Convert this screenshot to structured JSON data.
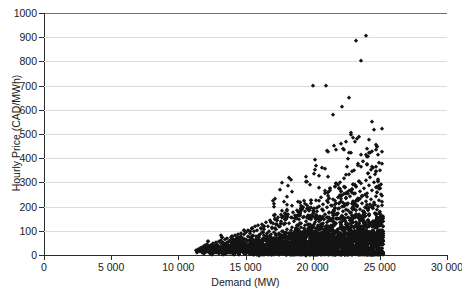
{
  "chart_data": {
    "type": "scatter",
    "title": "",
    "xlabel": "Demand (MW)",
    "ylabel": "Hourly Price (CAD/MWh)",
    "xlim": [
      0,
      30000
    ],
    "ylim": [
      0,
      1000
    ],
    "xticks": [
      0,
      5000,
      10000,
      15000,
      20000,
      25000,
      30000
    ],
    "xticklabels": [
      "0",
      "5 000",
      "10 000",
      "15 000",
      "20 000",
      "25 000",
      "30 000"
    ],
    "yticks": [
      0,
      100,
      200,
      300,
      400,
      500,
      600,
      700,
      800,
      900,
      1000
    ],
    "yticklabels": [
      "0",
      "100",
      "200",
      "300",
      "400",
      "500",
      "600",
      "700",
      "800",
      "900",
      "1000"
    ],
    "grid": "horizontal",
    "legend": "none",
    "marker": "diamond",
    "marker_color": "#141414",
    "series_name": "Hourly price vs demand",
    "notable_outliers": [
      {
        "x": 23200,
        "y": 885
      },
      {
        "x": 24000,
        "y": 905
      },
      {
        "x": 23600,
        "y": 800
      },
      {
        "x": 20000,
        "y": 700
      },
      {
        "x": 21000,
        "y": 700
      },
      {
        "x": 22700,
        "y": 650
      },
      {
        "x": 22200,
        "y": 610
      },
      {
        "x": 21500,
        "y": 580
      }
    ],
    "points": [
      [
        11300,
        20
      ],
      [
        11450,
        25
      ],
      [
        11520,
        18
      ],
      [
        11600,
        30
      ],
      [
        11700,
        22
      ],
      [
        11780,
        35
      ],
      [
        11850,
        28
      ],
      [
        11900,
        15
      ],
      [
        11950,
        40
      ],
      [
        12000,
        26
      ],
      [
        12050,
        33
      ],
      [
        12100,
        21
      ],
      [
        12150,
        45
      ],
      [
        12200,
        30
      ],
      [
        12250,
        24
      ],
      [
        12300,
        38
      ],
      [
        12350,
        29
      ],
      [
        12400,
        42
      ],
      [
        12450,
        27
      ],
      [
        12500,
        35
      ],
      [
        12550,
        48
      ],
      [
        12600,
        31
      ],
      [
        12650,
        22
      ],
      [
        12700,
        40
      ],
      [
        12750,
        36
      ],
      [
        12800,
        52
      ],
      [
        12850,
        28
      ],
      [
        12900,
        44
      ],
      [
        12950,
        33
      ],
      [
        13000,
        57
      ],
      [
        13050,
        39
      ],
      [
        13100,
        26
      ],
      [
        13150,
        48
      ],
      [
        13200,
        60
      ],
      [
        13250,
        35
      ],
      [
        13300,
        42
      ],
      [
        13350,
        55
      ],
      [
        13400,
        31
      ],
      [
        13450,
        66
      ],
      [
        13500,
        45
      ],
      [
        13550,
        38
      ],
      [
        13600,
        52
      ],
      [
        13650,
        70
      ],
      [
        13700,
        41
      ],
      [
        13750,
        59
      ],
      [
        13800,
        34
      ],
      [
        13850,
        63
      ],
      [
        13900,
        47
      ],
      [
        13950,
        75
      ],
      [
        14000,
        52
      ],
      [
        14050,
        40
      ],
      [
        14100,
        68
      ],
      [
        14150,
        57
      ],
      [
        14200,
        82
      ],
      [
        14250,
        45
      ],
      [
        14300,
        61
      ],
      [
        14350,
        73
      ],
      [
        14400,
        50
      ],
      [
        14450,
        88
      ],
      [
        14500,
        58
      ],
      [
        14550,
        66
      ],
      [
        14600,
        44
      ],
      [
        14650,
        79
      ],
      [
        14700,
        92
      ],
      [
        14750,
        55
      ],
      [
        14800,
        70
      ],
      [
        14850,
        62
      ],
      [
        14900,
        85
      ],
      [
        14950,
        48
      ],
      [
        15000,
        97
      ],
      [
        15050,
        68
      ],
      [
        15100,
        57
      ],
      [
        15150,
        80
      ],
      [
        15200,
        103
      ],
      [
        15250,
        63
      ],
      [
        15300,
        74
      ],
      [
        15350,
        90
      ],
      [
        15400,
        52
      ],
      [
        15450,
        110
      ],
      [
        15500,
        71
      ],
      [
        15550,
        84
      ],
      [
        15600,
        60
      ],
      [
        15650,
        98
      ],
      [
        15700,
        118
      ],
      [
        15750,
        67
      ],
      [
        15800,
        79
      ],
      [
        15850,
        105
      ],
      [
        15900,
        56
      ],
      [
        15950,
        125
      ],
      [
        16000,
        73
      ],
      [
        16050,
        88
      ],
      [
        16100,
        64
      ],
      [
        16150,
        112
      ],
      [
        16200,
        95
      ],
      [
        16250,
        130
      ],
      [
        16300,
        70
      ],
      [
        16350,
        82
      ],
      [
        16400,
        108
      ],
      [
        16450,
        61
      ],
      [
        16500,
        138
      ],
      [
        16550,
        76
      ],
      [
        16600,
        92
      ],
      [
        16650,
        120
      ],
      [
        16700,
        68
      ],
      [
        16750,
        101
      ],
      [
        16800,
        145
      ],
      [
        16850,
        79
      ],
      [
        16900,
        87
      ],
      [
        16950,
        115
      ],
      [
        17000,
        64
      ],
      [
        17050,
        132
      ],
      [
        17100,
        95
      ],
      [
        17150,
        72
      ],
      [
        17200,
        148
      ],
      [
        17250,
        84
      ],
      [
        17300,
        106
      ],
      [
        17350,
        128
      ],
      [
        17400,
        69
      ],
      [
        17450,
        155
      ],
      [
        17500,
        91
      ],
      [
        17550,
        77
      ],
      [
        17600,
        118
      ],
      [
        17650,
        140
      ],
      [
        17700,
        83
      ],
      [
        17750,
        99
      ],
      [
        17800,
        162
      ],
      [
        17850,
        74
      ],
      [
        17900,
        127
      ],
      [
        17950,
        88
      ],
      [
        18000,
        150
      ],
      [
        18050,
        95
      ],
      [
        18100,
        108
      ],
      [
        18150,
        170
      ],
      [
        18200,
        80
      ],
      [
        18250,
        134
      ],
      [
        18300,
        92
      ],
      [
        18350,
        158
      ],
      [
        18400,
        102
      ],
      [
        18450,
        116
      ],
      [
        18500,
        178
      ],
      [
        18550,
        86
      ],
      [
        18600,
        142
      ],
      [
        18650,
        97
      ],
      [
        18700,
        165
      ],
      [
        18750,
        110
      ],
      [
        18800,
        124
      ],
      [
        18850,
        186
      ],
      [
        18900,
        90
      ],
      [
        18950,
        150
      ],
      [
        19000,
        104
      ],
      [
        19050,
        172
      ],
      [
        19100,
        117
      ],
      [
        19150,
        132
      ],
      [
        19200,
        195
      ],
      [
        19250,
        95
      ],
      [
        19300,
        158
      ],
      [
        19350,
        110
      ],
      [
        19400,
        180
      ],
      [
        19450,
        123
      ],
      [
        19500,
        140
      ],
      [
        19550,
        205
      ],
      [
        19600,
        100
      ],
      [
        19650,
        166
      ],
      [
        19700,
        115
      ],
      [
        19750,
        188
      ],
      [
        19800,
        130
      ],
      [
        19850,
        148
      ],
      [
        19900,
        215
      ],
      [
        19950,
        105
      ],
      [
        20000,
        174
      ],
      [
        20050,
        120
      ],
      [
        20100,
        196
      ],
      [
        20150,
        136
      ],
      [
        20200,
        155
      ],
      [
        20250,
        228
      ],
      [
        20300,
        110
      ],
      [
        20350,
        182
      ],
      [
        20400,
        126
      ],
      [
        20450,
        204
      ],
      [
        20500,
        142
      ],
      [
        20550,
        163
      ],
      [
        20600,
        240
      ],
      [
        20650,
        115
      ],
      [
        20700,
        190
      ],
      [
        20750,
        132
      ],
      [
        20800,
        212
      ],
      [
        20850,
        150
      ],
      [
        20900,
        170
      ],
      [
        20950,
        255
      ],
      [
        21000,
        120
      ],
      [
        21050,
        198
      ],
      [
        21100,
        138
      ],
      [
        21150,
        220
      ],
      [
        21200,
        158
      ],
      [
        21250,
        178
      ],
      [
        21300,
        270
      ],
      [
        21350,
        126
      ],
      [
        21400,
        206
      ],
      [
        21450,
        144
      ],
      [
        21500,
        230
      ],
      [
        21550,
        165
      ],
      [
        21600,
        186
      ],
      [
        21650,
        285
      ],
      [
        21700,
        132
      ],
      [
        21750,
        215
      ],
      [
        21800,
        152
      ],
      [
        21850,
        240
      ],
      [
        21900,
        172
      ],
      [
        21950,
        195
      ],
      [
        22000,
        300
      ],
      [
        22050,
        138
      ],
      [
        22100,
        224
      ],
      [
        22150,
        160
      ],
      [
        22200,
        250
      ],
      [
        22250,
        180
      ],
      [
        22300,
        204
      ],
      [
        22350,
        318
      ],
      [
        22400,
        145
      ],
      [
        22450,
        234
      ],
      [
        22500,
        168
      ],
      [
        22550,
        262
      ],
      [
        22600,
        188
      ],
      [
        22650,
        214
      ],
      [
        22700,
        335
      ],
      [
        22750,
        152
      ],
      [
        22800,
        244
      ],
      [
        22850,
        176
      ],
      [
        22900,
        274
      ],
      [
        22950,
        196
      ],
      [
        23000,
        224
      ],
      [
        23050,
        352
      ],
      [
        23100,
        160
      ],
      [
        23150,
        255
      ],
      [
        23200,
        184
      ],
      [
        23250,
        286
      ],
      [
        23300,
        205
      ],
      [
        23350,
        234
      ],
      [
        23400,
        370
      ],
      [
        23450,
        168
      ],
      [
        23500,
        266
      ],
      [
        23550,
        192
      ],
      [
        23600,
        298
      ],
      [
        23650,
        214
      ],
      [
        23700,
        245
      ],
      [
        23750,
        390
      ],
      [
        23800,
        176
      ],
      [
        23850,
        278
      ],
      [
        23900,
        200
      ],
      [
        23950,
        310
      ],
      [
        24000,
        223
      ],
      [
        24050,
        256
      ],
      [
        24100,
        410
      ],
      [
        24150,
        184
      ],
      [
        24200,
        290
      ],
      [
        24250,
        209
      ],
      [
        24300,
        323
      ],
      [
        24350,
        232
      ],
      [
        24400,
        268
      ],
      [
        24450,
        430
      ],
      [
        24500,
        193
      ],
      [
        24550,
        302
      ],
      [
        24600,
        218
      ],
      [
        24650,
        336
      ],
      [
        24700,
        242
      ],
      [
        24750,
        280
      ],
      [
        24800,
        450
      ],
      [
        24850,
        202
      ],
      [
        24900,
        315
      ],
      [
        24950,
        228
      ],
      [
        25000,
        350
      ],
      [
        25050,
        252
      ],
      [
        25100,
        292
      ],
      [
        25150,
        205
      ],
      [
        25200,
        160
      ]
    ]
  }
}
